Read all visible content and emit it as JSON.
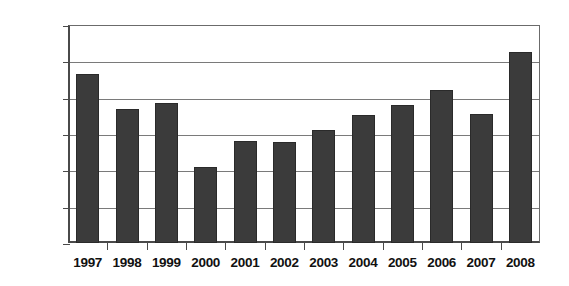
{
  "chart_data": {
    "type": "bar",
    "title": "",
    "subtitle": "",
    "xlabel": "",
    "ylabel": "",
    "categories": [
      "1997",
      "1998",
      "1999",
      "2000",
      "2001",
      "2002",
      "2003",
      "2004",
      "2005",
      "2006",
      "2007",
      "2008"
    ],
    "values": [
      432,
      385,
      392,
      304,
      340,
      339,
      355,
      376,
      390,
      410,
      378,
      463
    ],
    "ylim": [
      200,
      500
    ],
    "yticks": [
      200,
      250,
      300,
      350,
      400,
      450,
      500
    ],
    "ytick_labels": [
      "200",
      "250",
      "300",
      "350",
      "400",
      "450",
      "500"
    ],
    "grid": true,
    "legend": false,
    "legend_position": "none",
    "annotations": [],
    "series": [
      {
        "name": "",
        "values": [
          432,
          385,
          392,
          304,
          340,
          339,
          355,
          376,
          390,
          410,
          378,
          463
        ]
      }
    ]
  },
  "style": {
    "bar_color": "#3b3b3b",
    "bar_border_color": "#2a2a2a",
    "grid_color": "#7a7a7a",
    "axis_color": "#4a4a4a",
    "text_color": "#111111",
    "background": "#ffffff"
  }
}
